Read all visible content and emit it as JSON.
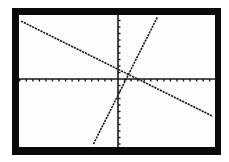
{
  "chart_data": {
    "type": "line",
    "title": "",
    "xlabel": "",
    "ylabel": "",
    "xlim": [
      -15,
      15
    ],
    "ylim": [
      -10,
      10
    ],
    "xtick_step": 1,
    "ytick_step": 1,
    "grid": false,
    "legend": null,
    "series": [
      {
        "name": "line-1",
        "equation": "y = -0.5x + 1.5",
        "slope": -0.5,
        "intercept": 1.5,
        "x": [
          -14.8,
          14.5
        ],
        "y": [
          8.9,
          -5.75
        ]
      },
      {
        "name": "line-2",
        "equation": "y = 2x - 2.5",
        "slope": 2,
        "intercept": -2.5,
        "x": [
          -3.75,
          6.0
        ],
        "y": [
          -10,
          9.5
        ]
      }
    ],
    "intersection": {
      "x": 1.6,
      "y": 0.7
    }
  },
  "colors": {
    "frame": "#0a0a0a",
    "screen": "#fdfdfd",
    "ink": "#1a1a1a"
  }
}
